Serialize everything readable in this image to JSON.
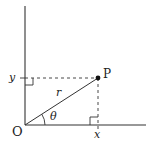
{
  "diagram": {
    "labels": {
      "origin": "O",
      "point": "P",
      "radius": "r",
      "angle": "θ",
      "x_coord": "x",
      "y_coord": "y"
    },
    "colors": {
      "line": "#333333",
      "background": "#ffffff"
    }
  }
}
